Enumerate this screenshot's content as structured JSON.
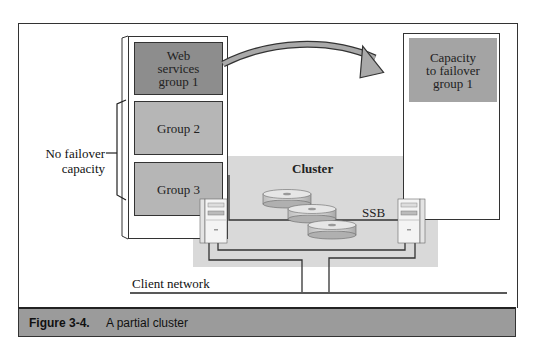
{
  "figure": {
    "caption_label": "Figure 3-4.",
    "caption_text": "A partial cluster"
  },
  "left_column": {
    "groups": [
      {
        "label": "Web services group 1",
        "lines": [
          "Web",
          "services",
          "group 1"
        ],
        "fill": "#8d8d8d"
      },
      {
        "label": "Group 2",
        "fill": "#b6b6b6"
      },
      {
        "label": "Group 3",
        "fill": "#b6b6b6"
      }
    ],
    "bracket_label_lines": [
      "No failover",
      "capacity"
    ]
  },
  "right_column": {
    "capacity_box": {
      "lines": [
        "Capacity",
        "to failover",
        "group 1"
      ],
      "fill": "#a4a4a4"
    }
  },
  "cluster": {
    "label": "Cluster",
    "storage_label": "SSB",
    "fill": "#d9d9d9",
    "disks": 3,
    "servers": 2
  },
  "network": {
    "label": "Client network"
  },
  "icons": [
    "failover-arrow-icon",
    "server-tower-icon",
    "disk-icon"
  ]
}
